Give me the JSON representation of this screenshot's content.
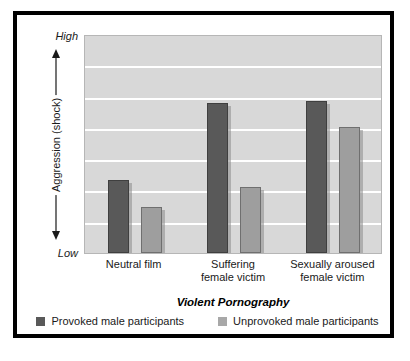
{
  "chart_data": {
    "type": "bar",
    "title": "",
    "xlabel": "Violent Pornography",
    "ylabel": "Aggression (shock)",
    "categories": [
      "Neutral film",
      "Suffering female victim",
      "Sexually aroused female victim"
    ],
    "category_lines": [
      [
        "Neutral film"
      ],
      [
        "Suffering",
        "female victim"
      ],
      [
        "Sexually aroused",
        "female victim"
      ]
    ],
    "series": [
      {
        "name": "Provoked male participants",
        "color": "#595959",
        "values": [
          2.33,
          4.79,
          4.85
        ]
      },
      {
        "name": "Unprovoked male participants",
        "color": "#9e9e9e",
        "values": [
          1.47,
          2.11,
          4.03
        ]
      }
    ],
    "ylim": [
      0,
      7
    ],
    "y_axis_min_label": "Low",
    "y_axis_max_label": "High",
    "y_tick_labels": [],
    "gridlines": 6,
    "grid": true,
    "legend_position": "bottom"
  },
  "axes": {
    "y_high": "High",
    "y_low": "Low",
    "y_title": "Aggression (shock)",
    "x_title": "Violent Pornography"
  },
  "legend": {
    "entries": [
      {
        "label": "Provoked male participants",
        "swatch": "provoked"
      },
      {
        "label": "Unprovoked male participants",
        "swatch": "unprovoked"
      }
    ]
  },
  "colors": {
    "provoked": "#595959",
    "unprovoked": "#9e9e9e",
    "plot_background": "#d8d8d8",
    "gridline": "#ffffff",
    "frame": "#000000",
    "page_background": "#ffffff"
  }
}
